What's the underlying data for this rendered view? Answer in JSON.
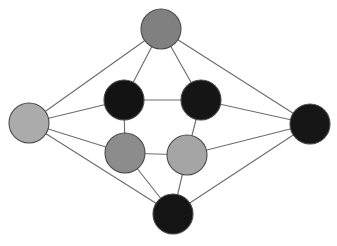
{
  "figure": {
    "background_color": "#ffffff",
    "width": 337,
    "height": 246
  },
  "style": {
    "edge_color": "#6e6e6e",
    "edge_width": 1.15,
    "node_outline_color": "#4a4a4a",
    "node_outline_width": 1.1
  },
  "graph_data": {
    "type": "node-link-diagram",
    "directed": false,
    "node_count": 8,
    "edge_count": 12,
    "nodes": [
      {
        "id": "outer-top",
        "label": "outer-top",
        "cx": 161,
        "cy": 29,
        "r": 20,
        "fill": "#808080",
        "shade": "medium-gray"
      },
      {
        "id": "outer-left",
        "label": "outer-left",
        "cx": 29,
        "cy": 123,
        "r": 20,
        "fill": "#ababab",
        "shade": "light-gray"
      },
      {
        "id": "outer-right",
        "label": "outer-right",
        "cx": 310,
        "cy": 124,
        "r": 20,
        "fill": "#161616",
        "shade": "black"
      },
      {
        "id": "outer-bottom",
        "label": "outer-bottom",
        "cx": 173,
        "cy": 214,
        "r": 20,
        "fill": "#141414",
        "shade": "black"
      },
      {
        "id": "inner-top-left",
        "label": "inner-top-left",
        "cx": 124,
        "cy": 100,
        "r": 20,
        "fill": "#131313",
        "shade": "black"
      },
      {
        "id": "inner-top-right",
        "label": "inner-top-right",
        "cx": 201,
        "cy": 100,
        "r": 20,
        "fill": "#151515",
        "shade": "black"
      },
      {
        "id": "inner-bottom-left",
        "label": "inner-bottom-left",
        "cx": 125,
        "cy": 153,
        "r": 20,
        "fill": "#8c8c8c",
        "shade": "medium-gray"
      },
      {
        "id": "inner-bottom-right",
        "label": "inner-bottom-right",
        "cx": 187,
        "cy": 155,
        "r": 20,
        "fill": "#a5a5a5",
        "shade": "light-gray"
      }
    ],
    "edges": [
      {
        "source": "outer-top",
        "target": "outer-left"
      },
      {
        "source": "outer-top",
        "target": "outer-right"
      },
      {
        "source": "outer-top",
        "target": "inner-top-left"
      },
      {
        "source": "outer-top",
        "target": "inner-top-right"
      },
      {
        "source": "outer-left",
        "target": "inner-top-left"
      },
      {
        "source": "outer-left",
        "target": "inner-bottom-left"
      },
      {
        "source": "outer-left",
        "target": "outer-bottom"
      },
      {
        "source": "outer-right",
        "target": "inner-top-right"
      },
      {
        "source": "outer-right",
        "target": "inner-bottom-right"
      },
      {
        "source": "outer-right",
        "target": "outer-bottom"
      },
      {
        "source": "outer-bottom",
        "target": "inner-bottom-left"
      },
      {
        "source": "outer-bottom",
        "target": "inner-bottom-right"
      },
      {
        "source": "inner-top-left",
        "target": "inner-top-right"
      },
      {
        "source": "inner-top-left",
        "target": "inner-bottom-left"
      },
      {
        "source": "inner-top-right",
        "target": "inner-bottom-right"
      },
      {
        "source": "inner-bottom-left",
        "target": "inner-bottom-right"
      }
    ]
  }
}
